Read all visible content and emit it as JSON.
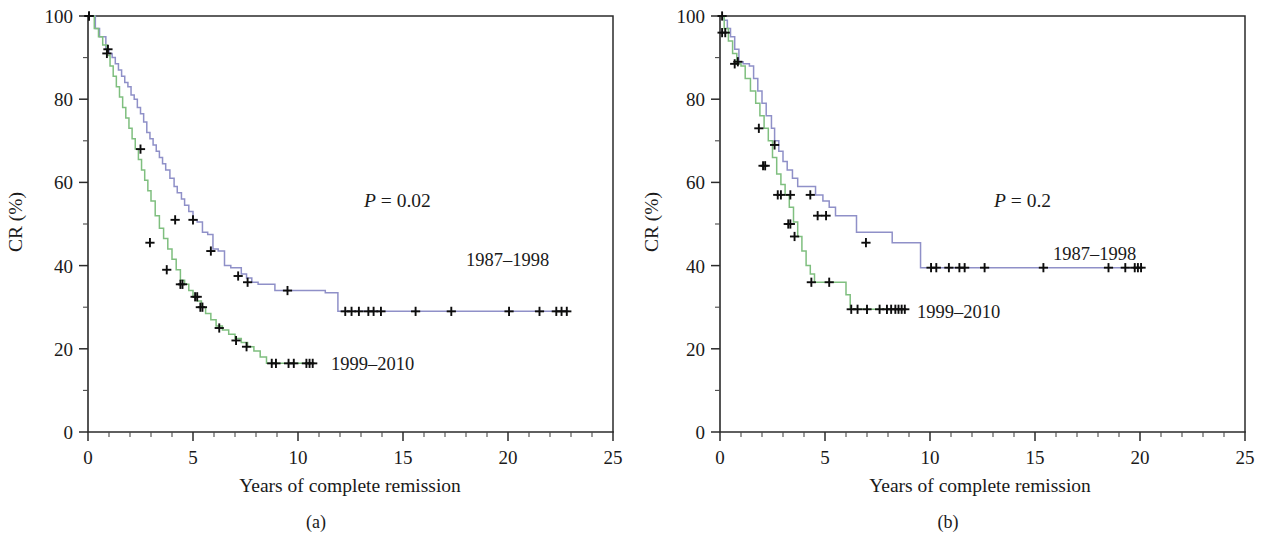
{
  "figure": {
    "type": "kaplan-meier-survival-figure",
    "panel_count": 2
  },
  "panels": [
    {
      "id": "a",
      "caption": "(a)",
      "xlabel": "Years of complete remission",
      "ylabel": "CR (%)",
      "pvalue_symbol": "P",
      "pvalue_text": " = 0.02",
      "label_1987": "1987–1998",
      "label_1999": "1999–2010"
    },
    {
      "id": "b",
      "caption": "(b)",
      "xlabel": "Years of complete remission",
      "ylabel": "CR (%)",
      "pvalue_symbol": "P",
      "pvalue_text": " = 0.2",
      "label_1987": "1987–1998",
      "label_1999": "1999–2010"
    }
  ],
  "chart_data": [
    {
      "panel": "a",
      "type": "line",
      "title": "",
      "xlabel": "Years of complete remission",
      "ylabel": "CR (%)",
      "xlim": [
        0,
        25
      ],
      "ylim": [
        0,
        100
      ],
      "xticks": [
        0,
        5,
        10,
        15,
        20,
        25
      ],
      "xticks_minor_step": 1,
      "yticks": [
        0,
        20,
        40,
        60,
        80,
        100
      ],
      "yticks_minor": [
        10,
        30,
        50,
        70,
        90
      ],
      "grid": false,
      "legend_position": "inline-annotations",
      "annotations": [
        {
          "text": "P = 0.02",
          "x": 13.5,
          "y": 52
        },
        {
          "text": "1987–1998",
          "x": 18.6,
          "y": 33
        },
        {
          "text": "1999–2010",
          "x": 12.3,
          "y": 16.5
        }
      ],
      "series": [
        {
          "name": "1987–1998",
          "color": "#8f90c8",
          "x": [
            0,
            0.35,
            0.55,
            0.85,
            1.0,
            1.15,
            1.3,
            1.45,
            1.6,
            1.75,
            1.9,
            2.05,
            2.2,
            2.35,
            2.5,
            2.65,
            2.8,
            2.95,
            3.1,
            3.25,
            3.4,
            3.55,
            3.7,
            3.9,
            4.1,
            4.25,
            4.45,
            4.6,
            4.8,
            5.0,
            5.2,
            5.45,
            5.7,
            5.95,
            6.2,
            6.5,
            6.8,
            7.1,
            7.3,
            7.55,
            7.8,
            8.1,
            8.9,
            11.3,
            11.9,
            22.9
          ],
          "y": [
            100,
            97,
            95,
            92,
            91,
            90,
            88.5,
            87,
            85.5,
            84,
            83,
            81,
            80,
            78,
            76.5,
            74.5,
            72,
            70.5,
            69,
            67.5,
            66,
            64.5,
            63,
            61,
            59,
            57.5,
            56,
            54.5,
            53,
            51,
            50.5,
            48,
            47.5,
            44,
            43.5,
            40,
            39.5,
            39.5,
            38,
            37,
            36,
            35.5,
            34,
            33.5,
            29,
            29
          ],
          "censor_x": [
            0.05,
            0.95,
            2.5,
            4.15,
            5.0,
            5.85,
            7.15,
            7.6,
            9.5,
            12.25,
            12.55,
            12.9,
            13.35,
            13.6,
            13.95,
            15.6,
            17.3,
            20.05,
            21.5,
            22.3,
            22.55,
            22.8
          ],
          "censor_y": [
            100,
            92,
            68,
            51,
            51,
            43.5,
            37.5,
            36,
            34,
            29,
            29,
            29,
            29,
            29,
            29,
            29,
            29,
            29,
            29,
            29,
            29,
            29
          ]
        },
        {
          "name": "1999–2010",
          "color": "#7fbf7f",
          "x": [
            0,
            0.3,
            0.5,
            0.7,
            0.9,
            1.05,
            1.2,
            1.35,
            1.5,
            1.65,
            1.8,
            1.95,
            2.1,
            2.25,
            2.4,
            2.55,
            2.7,
            2.85,
            3.0,
            3.2,
            3.4,
            3.6,
            3.8,
            4.0,
            4.2,
            4.4,
            4.6,
            4.8,
            5.0,
            5.2,
            5.4,
            5.6,
            5.85,
            6.1,
            6.4,
            6.7,
            7.0,
            7.3,
            7.6,
            7.9,
            8.2,
            8.5,
            10.8
          ],
          "y": [
            100,
            97,
            95,
            93,
            90.5,
            88,
            85.5,
            83,
            80.5,
            78,
            75.5,
            73,
            70.5,
            68,
            65.5,
            63,
            60.5,
            58,
            55.5,
            52,
            49,
            46.5,
            44,
            41.5,
            39,
            36.5,
            35.5,
            34,
            32.5,
            31.5,
            30,
            28.5,
            27,
            25.5,
            24.5,
            23.5,
            22.5,
            21.5,
            20.5,
            19.5,
            18,
            16.5,
            16.5
          ],
          "censor_x": [
            0.05,
            0.9,
            2.95,
            3.75,
            4.4,
            4.5,
            5.1,
            5.2,
            5.35,
            5.45,
            6.25,
            7.05,
            7.55,
            8.75,
            8.95,
            9.55,
            9.8,
            10.4,
            10.55,
            10.7
          ],
          "censor_y": [
            100,
            91,
            45.5,
            39,
            35.5,
            35.5,
            32.5,
            32.5,
            30,
            30,
            25,
            22,
            20.5,
            16.5,
            16.5,
            16.5,
            16.5,
            16.5,
            16.5,
            16.5
          ]
        }
      ]
    },
    {
      "panel": "b",
      "type": "line",
      "title": "",
      "xlabel": "Years of complete remission",
      "ylabel": "CR (%)",
      "xlim": [
        0,
        25
      ],
      "ylim": [
        0,
        100
      ],
      "xticks": [
        0,
        5,
        10,
        15,
        20,
        25
      ],
      "xticks_minor_step": 1,
      "yticks": [
        0,
        20,
        40,
        60,
        80,
        100
      ],
      "yticks_minor": [
        10,
        30,
        50,
        70,
        90
      ],
      "grid": false,
      "legend_position": "inline-annotations",
      "annotations": [
        {
          "text": "P = 0.2",
          "x": 13.5,
          "y": 52
        },
        {
          "text": "1987–1998",
          "x": 16.0,
          "y": 44
        },
        {
          "text": "1999–2010",
          "x": 9.3,
          "y": 29.5
        }
      ],
      "series": [
        {
          "name": "1987–1998",
          "color": "#8f90c8",
          "x": [
            0,
            0.2,
            0.35,
            0.5,
            0.7,
            0.9,
            1.1,
            1.4,
            1.6,
            1.8,
            2.0,
            2.2,
            2.45,
            2.6,
            2.8,
            3.0,
            3.2,
            3.45,
            3.7,
            4.0,
            4.3,
            4.55,
            4.9,
            5.2,
            5.5,
            6.1,
            6.5,
            7.4,
            8.2,
            9.2,
            9.55,
            20.1
          ],
          "y": [
            100,
            99,
            97,
            95,
            92,
            89,
            88.5,
            88,
            85,
            82,
            79,
            76,
            73,
            70,
            67.5,
            65,
            63,
            61,
            59,
            59,
            59,
            57,
            55.5,
            54,
            52,
            52,
            48,
            48,
            45.5,
            45.5,
            39.5,
            39.5
          ],
          "censor_x": [
            0.1,
            0.25,
            0.85,
            1.85,
            2.6,
            2.75,
            2.9,
            3.35,
            4.3,
            4.65,
            5.05,
            6.95,
            10.05,
            10.3,
            10.9,
            11.4,
            11.65,
            12.6,
            15.4,
            18.5,
            19.3,
            19.75,
            19.9,
            20.05
          ],
          "censor_y": [
            100,
            96,
            89,
            73,
            69,
            57,
            57,
            57,
            57,
            52,
            52,
            45.5,
            39.5,
            39.5,
            39.5,
            39.5,
            39.5,
            39.5,
            39.5,
            39.5,
            39.5,
            39.5,
            39.5,
            39.5
          ]
        },
        {
          "name": "1999–2010",
          "color": "#7fbf7f",
          "x": [
            0,
            0.2,
            0.4,
            0.6,
            0.8,
            1.0,
            1.2,
            1.45,
            1.7,
            1.9,
            2.1,
            2.3,
            2.5,
            2.7,
            2.9,
            3.1,
            3.3,
            3.5,
            3.7,
            3.9,
            4.1,
            4.3,
            4.5,
            5.3,
            5.7,
            6.0,
            6.2,
            8.8
          ],
          "y": [
            100,
            97,
            94,
            91,
            88.5,
            88,
            85,
            82,
            79,
            76,
            73,
            70,
            66,
            62,
            59.5,
            57,
            54,
            50.5,
            47,
            43.5,
            40,
            38,
            36,
            36,
            36,
            33,
            29.5,
            29.5
          ],
          "censor_x": [
            0.1,
            0.7,
            2.05,
            2.15,
            3.25,
            3.35,
            3.55,
            4.35,
            5.2,
            6.25,
            6.55,
            7.0,
            7.6,
            7.95,
            8.15,
            8.35,
            8.5,
            8.65,
            8.8
          ],
          "censor_y": [
            96,
            88.5,
            64,
            64,
            50,
            50,
            47,
            36,
            36,
            29.5,
            29.5,
            29.5,
            29.5,
            29.5,
            29.5,
            29.5,
            29.5,
            29.5,
            29.5
          ]
        }
      ]
    }
  ]
}
